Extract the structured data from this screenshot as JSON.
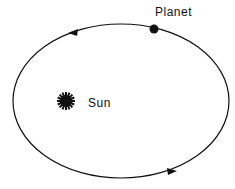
{
  "diagram": {
    "labels": {
      "planet": "Planet",
      "sun": "Sun"
    },
    "orbit": {
      "shape": "ellipse",
      "direction": "counterclockwise",
      "arrows": 2
    },
    "colors": {
      "stroke": "#111111",
      "background": "#ffffff"
    }
  }
}
